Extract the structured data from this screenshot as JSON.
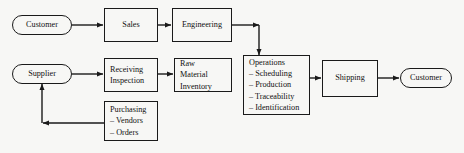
{
  "diagram": {
    "background_color": "#f7f7f5",
    "line_color": "#1a1a1a",
    "text_color": "#111111",
    "nodes": {
      "customer_start": {
        "label": "Customer",
        "shape": "terminator"
      },
      "sales": {
        "label": "Sales",
        "shape": "process"
      },
      "engineering": {
        "label": "Engineering",
        "shape": "process"
      },
      "supplier": {
        "label": "Supplier",
        "shape": "terminator"
      },
      "receiving_inspection": {
        "label_line1": "Receiving",
        "label_line2": "Inspection",
        "shape": "process"
      },
      "raw_material_inventory": {
        "label_line1": "Raw",
        "label_line2": "Material",
        "label_line3": "Inventory",
        "shape": "process"
      },
      "purchasing": {
        "label": "Purchasing",
        "shape": "process",
        "items": [
          "– Vendors",
          "– Orders"
        ]
      },
      "operations": {
        "label": "Operations",
        "shape": "process",
        "items": [
          "– Scheduling",
          "– Production",
          "– Traceability",
          "– Identification"
        ]
      },
      "shipping": {
        "label": "Shipping",
        "shape": "process"
      },
      "customer_end": {
        "label": "Customer",
        "shape": "terminator"
      }
    },
    "edges": [
      {
        "from": "customer_start",
        "to": "sales"
      },
      {
        "from": "sales",
        "to": "engineering"
      },
      {
        "from": "engineering",
        "to": "operations"
      },
      {
        "from": "supplier",
        "to": "receiving_inspection"
      },
      {
        "from": "receiving_inspection",
        "to": "raw_material_inventory"
      },
      {
        "from": "purchasing",
        "to": "supplier"
      },
      {
        "from": "operations",
        "to": "shipping"
      },
      {
        "from": "shipping",
        "to": "customer_end"
      }
    ]
  }
}
